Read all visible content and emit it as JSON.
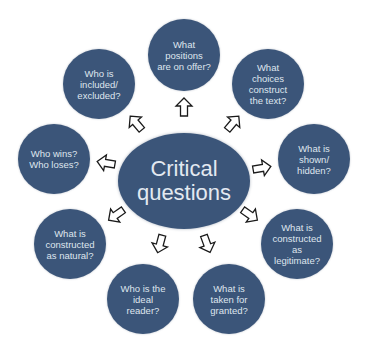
{
  "colors": {
    "node_fill": "#3b5579",
    "text": "#dfe5ee",
    "arrow_stroke": "#1a1a1a",
    "arrow_fill": "#ffffff",
    "background": "#ffffff"
  },
  "center": {
    "label": "Critical\nquestions"
  },
  "nodes": [
    {
      "id": "top",
      "label": "What\npositions\nare on offer?"
    },
    {
      "id": "top-right",
      "label": "What\nchoices\nconstruct\nthe text?"
    },
    {
      "id": "right",
      "label": "What is\nshown/\nhidden?"
    },
    {
      "id": "lower-right",
      "label": "What is\nconstructed\nas\nlegitimate?"
    },
    {
      "id": "bottom-right",
      "label": "What is\ntaken for\ngranted?"
    },
    {
      "id": "bottom-left",
      "label": "Who is the\nideal\nreader?"
    },
    {
      "id": "lower-left",
      "label": "What is\nconstructed\nas natural?"
    },
    {
      "id": "left",
      "label": "Who wins?\nWho loses?"
    },
    {
      "id": "top-left",
      "label": "Who is\nincluded/\nexcluded?"
    }
  ],
  "arrows": [
    {
      "to": "top",
      "icon": "arrow-up-icon"
    },
    {
      "to": "top-right",
      "icon": "arrow-up-right-icon"
    },
    {
      "to": "right",
      "icon": "arrow-right-icon"
    },
    {
      "to": "lower-right",
      "icon": "arrow-down-right-icon"
    },
    {
      "to": "bottom-right",
      "icon": "arrow-down-icon"
    },
    {
      "to": "bottom-left",
      "icon": "arrow-down-icon"
    },
    {
      "to": "lower-left",
      "icon": "arrow-down-left-icon"
    },
    {
      "to": "left",
      "icon": "arrow-left-icon"
    },
    {
      "to": "top-left",
      "icon": "arrow-up-left-icon"
    }
  ]
}
